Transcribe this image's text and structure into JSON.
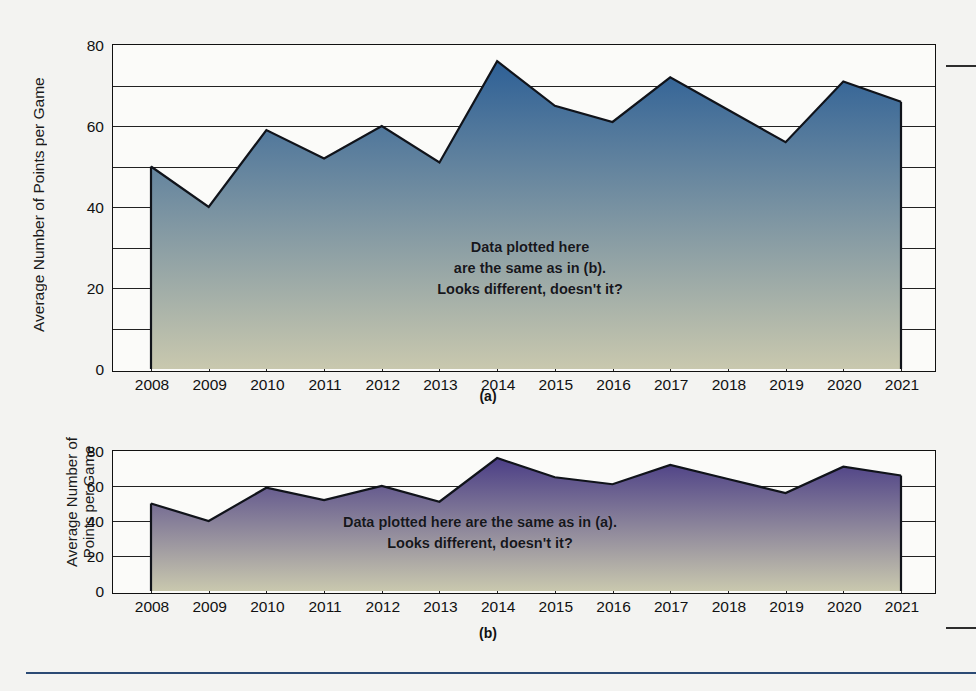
{
  "figure_a": {
    "caption": "(a)",
    "ylabel": "Average Number of Points per Game",
    "annotation": "Data plotted here\nare the same as in (b).\nLooks different, doesn't it?"
  },
  "figure_b": {
    "caption": "(b)",
    "ylabel": "Average Number of\nPoints per Game",
    "annotation": "Data plotted here are the same as in (a).\nLooks different, doesn't it?"
  },
  "chart_data": [
    {
      "type": "area",
      "id": "a",
      "title": "",
      "xlabel": "",
      "ylabel": "Average Number of Points per Game",
      "categories": [
        "2008",
        "2009",
        "2010",
        "2011",
        "2012",
        "2013",
        "2014",
        "2015",
        "2016",
        "2017",
        "2018",
        "2019",
        "2020",
        "2021"
      ],
      "x": [
        2008,
        2009,
        2010,
        2011,
        2012,
        2013,
        2014,
        2015,
        2016,
        2017,
        2018,
        2019,
        2020,
        2021
      ],
      "values": [
        50,
        40,
        59,
        52,
        60,
        51,
        76,
        65,
        61,
        72,
        64,
        56,
        71,
        66
      ],
      "ylim": [
        0,
        80
      ],
      "ytick_labels": [
        "0",
        "20",
        "40",
        "60",
        "80"
      ],
      "ytick_values": [
        0,
        20,
        40,
        60,
        80
      ],
      "gridline_values": [
        10,
        20,
        30,
        40,
        50,
        60,
        70
      ],
      "grid": true,
      "legend": "none",
      "fill_top_color": "#2e6096",
      "fill_bottom_color": "#c9c8ae",
      "line_color": "#10131a"
    },
    {
      "type": "area",
      "id": "b",
      "title": "",
      "xlabel": "",
      "ylabel": "Average Number of Points per Game",
      "categories": [
        "2008",
        "2009",
        "2010",
        "2011",
        "2012",
        "2013",
        "2014",
        "2015",
        "2016",
        "2017",
        "2018",
        "2019",
        "2020",
        "2021"
      ],
      "x": [
        2008,
        2009,
        2010,
        2011,
        2012,
        2013,
        2014,
        2015,
        2016,
        2017,
        2018,
        2019,
        2020,
        2021
      ],
      "values": [
        50,
        40,
        59,
        52,
        60,
        51,
        76,
        65,
        61,
        72,
        64,
        56,
        71,
        66
      ],
      "ylim": [
        0,
        80
      ],
      "ytick_labels": [
        "0",
        "20",
        "40",
        "60",
        "80"
      ],
      "ytick_values": [
        0,
        20,
        40,
        60,
        80
      ],
      "gridline_values": [
        20,
        40,
        60
      ],
      "grid": true,
      "legend": "none",
      "fill_top_color": "#4b3e86",
      "fill_bottom_color": "#c9c8ae",
      "line_color": "#10131a"
    }
  ]
}
